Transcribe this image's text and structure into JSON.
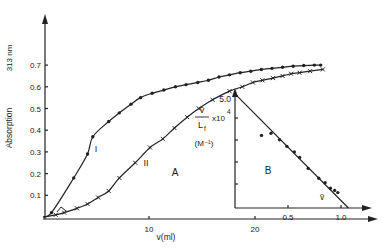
{
  "chart_data": [
    {
      "panel": "A",
      "type": "line",
      "title": "",
      "xlabel": "v(ml)",
      "ylabel": "Absorption  313 nm",
      "xlim": [
        0,
        28
      ],
      "ylim": [
        0,
        0.8
      ],
      "x_ticks": [
        10,
        20
      ],
      "y_ticks": [
        0.1,
        0.2,
        0.3,
        0.4,
        0.5,
        0.6,
        0.7
      ],
      "y_tick_labels": [
        "0.1",
        "0.2",
        "0.3",
        "0.4",
        "0.5",
        "0.6",
        "0.7"
      ],
      "x_tick_labels": [
        "10",
        "20"
      ],
      "grid": false,
      "panel_label": "A",
      "series": [
        {
          "name": "I",
          "marker": "dot",
          "points": [
            [
              0.8,
              0.02
            ],
            [
              2.9,
              0.18
            ],
            [
              4.2,
              0.29
            ],
            [
              4.7,
              0.37
            ],
            [
              6.2,
              0.44
            ],
            [
              7.2,
              0.48
            ],
            [
              8.3,
              0.52
            ],
            [
              9.2,
              0.55
            ],
            [
              10.3,
              0.57
            ],
            [
              11.4,
              0.585
            ],
            [
              12.5,
              0.6
            ],
            [
              13.5,
              0.61
            ],
            [
              14.6,
              0.62
            ],
            [
              15.6,
              0.63
            ],
            [
              16.6,
              0.645
            ],
            [
              17.6,
              0.655
            ],
            [
              18.6,
              0.665
            ],
            [
              19.6,
              0.672
            ],
            [
              20.6,
              0.68
            ],
            [
              21.6,
              0.685
            ],
            [
              22.6,
              0.69
            ],
            [
              23.6,
              0.695
            ],
            [
              24.6,
              0.698
            ],
            [
              25.6,
              0.7
            ],
            [
              26.2,
              0.7
            ]
          ]
        },
        {
          "name": "II",
          "marker": "cross",
          "points": [
            [
              1.2,
              0.01
            ],
            [
              2.0,
              0.02
            ],
            [
              3.2,
              0.04
            ],
            [
              4.2,
              0.06
            ],
            [
              5.2,
              0.09
            ],
            [
              6.2,
              0.12
            ],
            [
              7.2,
              0.18
            ],
            [
              8.7,
              0.25
            ],
            [
              10.1,
              0.32
            ],
            [
              11.3,
              0.36
            ],
            [
              12.4,
              0.41
            ],
            [
              13.6,
              0.46
            ],
            [
              14.7,
              0.5
            ],
            [
              16.0,
              0.54
            ],
            [
              17.6,
              0.58
            ],
            [
              18.8,
              0.6
            ],
            [
              19.8,
              0.62
            ],
            [
              20.7,
              0.63
            ],
            [
              21.7,
              0.64
            ],
            [
              22.6,
              0.65
            ],
            [
              23.4,
              0.66
            ],
            [
              24.2,
              0.665
            ],
            [
              25.2,
              0.672
            ],
            [
              26.4,
              0.68
            ]
          ]
        }
      ],
      "annotations": [
        "I",
        "II",
        "A"
      ]
    },
    {
      "panel": "B",
      "type": "scatter",
      "xlabel": "ν̄",
      "ylabel": "ν̄/L_f ×10^4 (M⁻¹)",
      "xlim": [
        0,
        1.2
      ],
      "ylim": [
        0,
        5.5
      ],
      "x_ticks": [
        0.5,
        1.0
      ],
      "x_tick_labels": [
        "0.5",
        "1.0"
      ],
      "y_ticks": [
        1,
        2,
        3,
        4,
        5
      ],
      "y_tick_labels": [
        "5.0"
      ],
      "grid": false,
      "panel_label": "B",
      "fit_line": [
        [
          0,
          5.1
        ],
        [
          1.07,
          0
        ]
      ],
      "series": [
        {
          "name": "data",
          "points": [
            [
              0.25,
              3.3
            ],
            [
              0.34,
              3.4
            ],
            [
              0.42,
              3.1
            ],
            [
              0.49,
              2.8
            ],
            [
              0.56,
              2.55
            ],
            [
              0.61,
              2.3
            ],
            [
              0.69,
              1.8
            ],
            [
              0.79,
              1.35
            ],
            [
              0.85,
              1.15
            ],
            [
              0.9,
              0.9
            ],
            [
              0.94,
              0.8
            ],
            [
              0.97,
              0.7
            ]
          ]
        }
      ]
    }
  ],
  "labels": {
    "y_axis_main": "Absorption",
    "y_axis_unit": "313 nm",
    "x_axis_main": "v(ml)",
    "curve_I": "I",
    "curve_II": "II",
    "panel_A": "A",
    "panel_B": "B",
    "inset_y_num": "v̄",
    "inset_y_den": "L",
    "inset_y_den_sub": "f",
    "inset_y_mult": "x10",
    "inset_y_exp": "4",
    "inset_y_unit": "(M⁻¹)",
    "inset_y_tick": "5.0",
    "inset_x_label": "v̄"
  }
}
